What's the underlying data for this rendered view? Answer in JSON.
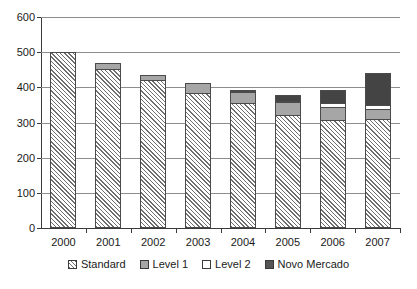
{
  "chart_data": {
    "type": "bar",
    "stacked": true,
    "title": "",
    "subtitle": "",
    "xlabel": "",
    "ylabel": "",
    "ylim": [
      0,
      600
    ],
    "ytick_step": 100,
    "yticks": [
      "0",
      "100",
      "200",
      "300",
      "400",
      "500",
      "600"
    ],
    "grid": true,
    "legend_position": "bottom",
    "categories": [
      "2000",
      "2001",
      "2002",
      "2003",
      "2004",
      "2005",
      "2006",
      "2007"
    ],
    "series": [
      {
        "name": "Standard",
        "color": "#ffffff",
        "pattern": "diagonal-hatch",
        "values": [
          500,
          453,
          420,
          383,
          355,
          322,
          307,
          310
        ]
      },
      {
        "name": "Level 1",
        "color": "#a6a6a6",
        "pattern": "solid",
        "values": [
          0,
          18,
          19,
          32,
          35,
          40,
          40,
          31
        ]
      },
      {
        "name": "Level 2",
        "color": "#ffffff",
        "pattern": "solid",
        "values": [
          0,
          0,
          0,
          0,
          3,
          4,
          14,
          15
        ]
      },
      {
        "name": "Novo Mercado",
        "color": "#444444",
        "pattern": "solid",
        "values": [
          0,
          0,
          0,
          0,
          4,
          18,
          39,
          94
        ]
      }
    ],
    "totals": [
      500,
      471,
      439,
      415,
      397,
      384,
      400,
      450
    ]
  },
  "legend": {
    "items": [
      {
        "label": "Standard",
        "swatch": "hatched-swatch"
      },
      {
        "label": "Level 1",
        "swatch": "gray-swatch"
      },
      {
        "label": "Level 2",
        "swatch": "white-swatch"
      },
      {
        "label": "Novo Mercado",
        "swatch": "dark-swatch"
      }
    ]
  }
}
